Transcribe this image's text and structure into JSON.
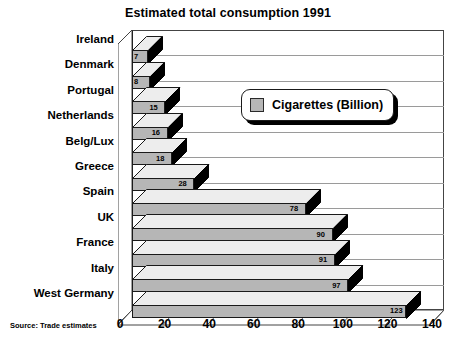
{
  "chart_data": {
    "type": "bar",
    "orientation": "horizontal",
    "title": "Estimated total consumption 1991",
    "xlabel": "",
    "ylabel": "",
    "xlim": [
      0,
      140
    ],
    "xticks": [
      0,
      20,
      40,
      60,
      80,
      100,
      120,
      140
    ],
    "grid": true,
    "legend_position": "inside-top-right",
    "categories": [
      "Ireland",
      "Denmark",
      "Portugal",
      "Netherlands",
      "Belg/Lux",
      "Greece",
      "Spain",
      "UK",
      "France",
      "Italy",
      "West Germany"
    ],
    "series": [
      {
        "name": "Cigarettes (Billion)",
        "color": "#b6b6b6",
        "values": [
          7,
          8,
          15,
          16,
          18,
          28,
          78,
          90,
          91,
          97,
          123
        ]
      }
    ],
    "annotations": {
      "source": "Source: Trade estimates"
    }
  },
  "legend": {
    "label": "Cigarettes (Billion)",
    "swatch_color": "#b6b6b6"
  },
  "footer": {
    "source": "Source: Trade estimates"
  }
}
